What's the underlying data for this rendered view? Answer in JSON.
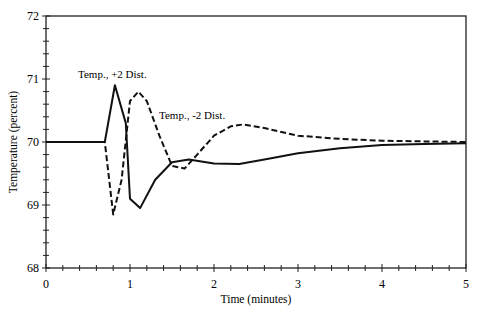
{
  "chart_data": {
    "type": "line",
    "title": "",
    "xlabel": "Time (minutes)",
    "ylabel": "Temperature (percent)",
    "xlim": [
      0,
      5
    ],
    "ylim": [
      68,
      72
    ],
    "x_ticks": [
      "0",
      "1",
      "2",
      "3",
      "4",
      "5"
    ],
    "y_ticks": [
      "68",
      "69",
      "70",
      "71",
      "72"
    ],
    "grid": false,
    "legend": "none (inline annotations)",
    "annotations": [
      {
        "text": "Temp., +2 Dist.",
        "x": 0.05,
        "y": 71.05
      },
      {
        "text": "Temp., -2 Dist.",
        "x": 1.3,
        "y": 70.55
      }
    ],
    "series": [
      {
        "name": "Temp., +2 Dist.",
        "style": "solid",
        "x": [
          0,
          0.7,
          0.82,
          0.95,
          1.0,
          1.12,
          1.3,
          1.5,
          1.7,
          2.0,
          2.3,
          2.6,
          3.0,
          3.5,
          4.0,
          4.5,
          5.0
        ],
        "y": [
          70.0,
          70.0,
          70.9,
          70.3,
          69.1,
          68.95,
          69.4,
          69.68,
          69.72,
          69.66,
          69.65,
          69.72,
          69.82,
          69.9,
          69.95,
          69.97,
          69.98
        ]
      },
      {
        "name": "Temp., -2 Dist.",
        "style": "dashed",
        "x": [
          0,
          0.7,
          0.8,
          0.9,
          1.0,
          1.1,
          1.2,
          1.35,
          1.5,
          1.65,
          1.8,
          2.0,
          2.2,
          2.35,
          2.6,
          3.0,
          3.5,
          4.0,
          4.5,
          5.0
        ],
        "y": [
          70.0,
          70.0,
          68.85,
          69.4,
          70.65,
          70.8,
          70.65,
          70.1,
          69.62,
          69.58,
          69.8,
          70.1,
          70.25,
          70.28,
          70.22,
          70.1,
          70.05,
          70.02,
          70.01,
          70.0
        ]
      }
    ]
  }
}
